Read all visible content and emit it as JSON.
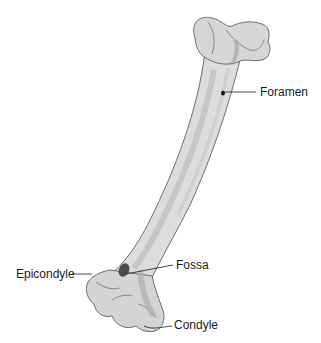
{
  "diagram": {
    "labels": {
      "foramen": "Foramen",
      "fossa": "Fossa",
      "epicondyle": "Epicondyle",
      "condyle": "Condyle"
    },
    "colors": {
      "bone_fill": "#dcdcdc",
      "bone_shade": "#b8b8b8",
      "bone_outline": "#6e6e6e",
      "fossa": "#4a4a4a",
      "label_text": "#1a1a1a"
    }
  }
}
